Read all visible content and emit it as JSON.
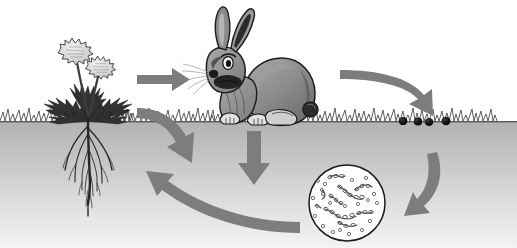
{
  "diagram": {
    "title": "Nutrient cycle: plant to rabbit to droppings to decomposers to soil",
    "caption": "",
    "background_color": "#ffffff",
    "arrow_color": "#7d7d7d",
    "ground_line_color": "#4a4a4a",
    "soil_top_color": "#b4b4b4",
    "soil_bottom_color": "#f2f2f2",
    "ground_line_y": 121
  },
  "nodes": [
    {
      "id": "plant",
      "label": "dandelion-plant",
      "caption": "",
      "x": 88,
      "y": 70,
      "colors": {
        "flower": "#d9d9d9",
        "leaf": "#3b3b3b",
        "root": "#2e2e2e"
      },
      "flower_count": 2
    },
    {
      "id": "roots",
      "label": "plant-roots",
      "caption": "",
      "x": 88,
      "y": 170,
      "colors": {
        "root": "#262626"
      }
    },
    {
      "id": "rabbit",
      "label": "rabbit",
      "caption": "",
      "x": 265,
      "y": 70,
      "colors": {
        "body": "#8a8a8a",
        "shadow": "#5e5e5e",
        "ear_inner": "#2b2b2b",
        "eye": "#ffffff",
        "outline": "#1c1c1c"
      }
    },
    {
      "id": "droppings",
      "label": "rabbit-droppings",
      "caption": "",
      "x": 424,
      "y": 122,
      "count": 4,
      "color": "#0d0d0d",
      "positions": [
        403,
        418,
        429,
        446
      ]
    },
    {
      "id": "microbes",
      "label": "decomposer-bacteria-dish",
      "caption": "",
      "x": 347,
      "y": 203,
      "radius": 38,
      "colors": {
        "rim": "#1a1a1a",
        "fill": "#ffffff",
        "cell": "#55555a"
      },
      "rod_count": 9,
      "cocci_count": 18
    }
  ],
  "arrows": [
    {
      "id": "a1",
      "name": "arrow-plant-to-rabbit",
      "from": "plant",
      "to": "rabbit",
      "shape": "straight-right",
      "caption": ""
    },
    {
      "id": "a2",
      "name": "arrow-rabbit-to-droppings",
      "from": "rabbit",
      "to": "droppings",
      "shape": "curve-right-down",
      "caption": ""
    },
    {
      "id": "a3",
      "name": "arrow-droppings-to-microbes",
      "from": "droppings",
      "to": "microbes",
      "shape": "curve-down-left",
      "caption": ""
    },
    {
      "id": "a4",
      "name": "arrow-microbes-to-roots",
      "from": "microbes",
      "to": "roots",
      "shape": "curve-left-up",
      "caption": ""
    },
    {
      "id": "a5",
      "name": "arrow-plant-into-soil",
      "from": "plant",
      "to": "soil",
      "shape": "curve-down-right",
      "caption": ""
    },
    {
      "id": "a6",
      "name": "arrow-rabbit-into-soil",
      "from": "rabbit",
      "to": "soil",
      "shape": "straight-down",
      "caption": ""
    }
  ]
}
